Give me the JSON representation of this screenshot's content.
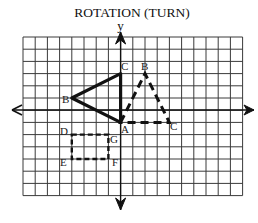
{
  "title": "ROTATION (TURN)",
  "axes": {
    "y_label": "y",
    "x_label": ""
  },
  "grid": {
    "columns": 18,
    "rows": 13,
    "origin_col": 8,
    "origin_row": 6
  },
  "figures": {
    "original_triangle": {
      "style": "solid",
      "vertices": [
        {
          "name": "A",
          "x": 0,
          "y": -1
        },
        {
          "name": "B",
          "x": -4,
          "y": 1
        },
        {
          "name": "C",
          "x": 0,
          "y": 3
        }
      ]
    },
    "rotated_triangle": {
      "style": "dashed",
      "vertices": [
        {
          "name": "A",
          "x": 0,
          "y": -1
        },
        {
          "name": "B",
          "x": 2,
          "y": 3
        },
        {
          "name": "C",
          "x": 4,
          "y": -1
        }
      ]
    },
    "rectangle": {
      "style": "dashed",
      "vertices": [
        {
          "name": "D",
          "x": -4,
          "y": -2
        },
        {
          "name": "G",
          "x": -1,
          "y": -2
        },
        {
          "name": "F",
          "x": -1,
          "y": -4
        },
        {
          "name": "E",
          "x": -4,
          "y": -4
        }
      ]
    }
  },
  "labels": {
    "A": "A",
    "B": "B",
    "C": "C",
    "B2": "B",
    "C2": "C",
    "D": "D",
    "E": "E",
    "F": "F",
    "G": "G"
  },
  "colors": {
    "ink": "#111111",
    "grid": "#3a3a3a",
    "background": "#ffffff"
  }
}
